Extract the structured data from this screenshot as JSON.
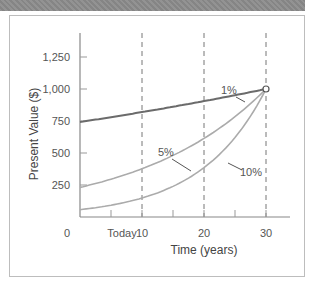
{
  "chart_data": {
    "type": "line",
    "title": "",
    "xlabel": "Time (years)",
    "ylabel": "Present Value ($)",
    "x_origin_label": "Today",
    "xlim": [
      0,
      33
    ],
    "ylim": [
      0,
      1400
    ],
    "x_ticks": [
      0,
      10,
      20,
      30
    ],
    "x_tick_labels": [
      "0",
      "10",
      "20",
      "30"
    ],
    "y_ticks": [
      250,
      500,
      750,
      1000,
      1250
    ],
    "y_tick_labels": [
      "250",
      "500",
      "750",
      "1,000",
      "1,250"
    ],
    "grid": "vertical dashed lines at x = 10, 20, 30",
    "legend": "inline labels",
    "x": [
      0,
      5,
      10,
      15,
      20,
      25,
      30
    ],
    "series": [
      {
        "name": "1%",
        "rate": 0.01,
        "color": "#6b6b6b",
        "values": [
          742,
          780,
          820,
          861,
          905,
          951,
          1000
        ]
      },
      {
        "name": "5%",
        "rate": 0.05,
        "color": "#ababab",
        "values": [
          231,
          295,
          377,
          481,
          614,
          784,
          1000
        ]
      },
      {
        "name": "10%",
        "rate": 0.1,
        "color": "#ababab",
        "values": [
          57,
          92,
          149,
          239,
          386,
          621,
          1000
        ]
      }
    ],
    "annotations": [
      {
        "type": "open-circle",
        "x": 30,
        "y": 1000
      }
    ]
  }
}
